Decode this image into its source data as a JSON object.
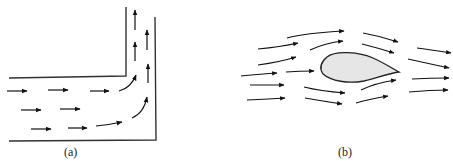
{
  "figure": {
    "panels": [
      {
        "id": "a",
        "label": "(a)",
        "description": "Flow turning through a 90-degree bend in a channel",
        "wall_color": "#333333",
        "arrow_color": "#111111"
      },
      {
        "id": "b",
        "label": "(b)",
        "description": "Streamlines of flow around an airfoil-shaped body",
        "body_fill": "#e6e6e6",
        "body_stroke": "#222222",
        "arrow_color": "#111111"
      }
    ]
  }
}
